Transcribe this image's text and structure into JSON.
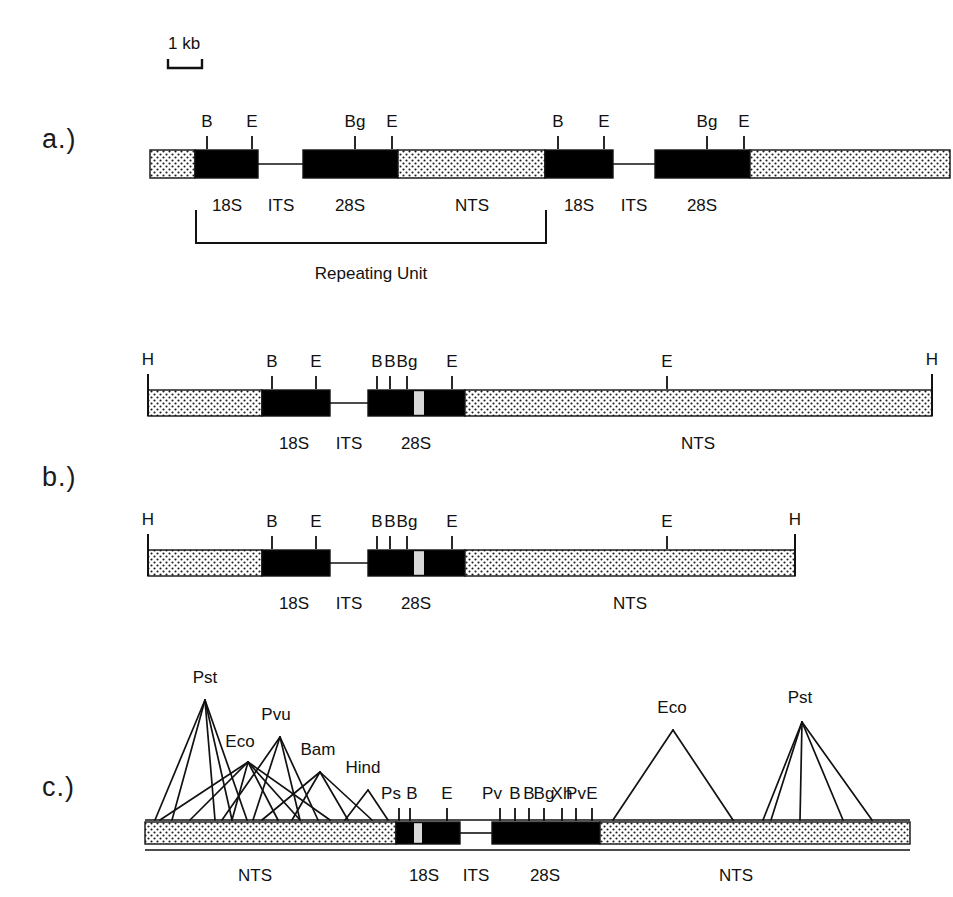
{
  "figure": {
    "type": "restriction-map-diagram",
    "scale_bar": {
      "label": "1 kb",
      "x": 168,
      "y": 48,
      "bar_left": 168,
      "bar_right": 202,
      "bar_y": 68
    },
    "panels": [
      {
        "id": "a",
        "letter": "a.)",
        "letter_x": 42,
        "letter_y": 142,
        "description": "Tandemly repeated ribosomal DNA unit, two repeats shown",
        "axis": {
          "left": 150,
          "right": 950,
          "y": 150,
          "height": 28
        },
        "segments": [
          {
            "kind": "stipple",
            "x1": 150,
            "x2": 195,
            "label": ""
          },
          {
            "kind": "solid",
            "x1": 195,
            "x2": 258,
            "label": "18S"
          },
          {
            "kind": "line",
            "x1": 258,
            "x2": 303,
            "label": "ITS"
          },
          {
            "kind": "solid",
            "x1": 303,
            "x2": 398,
            "label": "28S"
          },
          {
            "kind": "stipple",
            "x1": 398,
            "x2": 545,
            "label": "NTS"
          },
          {
            "kind": "solid",
            "x1": 545,
            "x2": 613,
            "label": "18S"
          },
          {
            "kind": "line",
            "x1": 613,
            "x2": 655,
            "label": "ITS"
          },
          {
            "kind": "solid",
            "x1": 655,
            "x2": 750,
            "label": "28S"
          },
          {
            "kind": "stipple",
            "x1": 750,
            "x2": 950,
            "label": ""
          }
        ],
        "sites": [
          {
            "label": "B",
            "x": 207
          },
          {
            "label": "E",
            "x": 252
          },
          {
            "label": "Bg",
            "x": 355
          },
          {
            "label": "E",
            "x": 392
          },
          {
            "label": "B",
            "x": 558
          },
          {
            "label": "E",
            "x": 604
          },
          {
            "label": "Bg",
            "x": 707
          },
          {
            "label": "E",
            "x": 744
          }
        ],
        "region_labels": [
          {
            "text": "18S",
            "x": 227,
            "y": 196
          },
          {
            "text": "ITS",
            "x": 281,
            "y": 196
          },
          {
            "text": "28S",
            "x": 350,
            "y": 196
          },
          {
            "text": "NTS",
            "x": 472,
            "y": 196
          },
          {
            "text": "18S",
            "x": 579,
            "y": 196
          },
          {
            "text": "ITS",
            "x": 634,
            "y": 196
          },
          {
            "text": "28S",
            "x": 702,
            "y": 196
          }
        ],
        "bracket": {
          "label": "Repeating Unit",
          "x1": 196,
          "x2": 546,
          "y_top": 210,
          "y_bottom": 243,
          "label_x": 371,
          "label_y": 264
        }
      },
      {
        "id": "b",
        "letter": "b.)",
        "letter_x": 42,
        "letter_y": 480,
        "description": "Two HindIII repeat-length variants of the rDNA unit",
        "maps": [
          {
            "axis": {
              "left": 148,
              "right": 932,
              "y": 390,
              "height": 26
            },
            "segments": [
              {
                "kind": "stipple",
                "x1": 148,
                "x2": 262,
                "label": ""
              },
              {
                "kind": "solid",
                "x1": 262,
                "x2": 330,
                "label": "18S"
              },
              {
                "kind": "line",
                "x1": 330,
                "x2": 368,
                "label": "ITS"
              },
              {
                "kind": "solid",
                "x1": 368,
                "x2": 465,
                "label": "28S"
              },
              {
                "kind": "stipple",
                "x1": 465,
                "x2": 932,
                "label": "NTS"
              }
            ],
            "inner_gap": {
              "x1": 414,
              "x2": 424
            },
            "end_ticks": [
              {
                "label": "H",
                "x": 148
              },
              {
                "label": "H",
                "x": 932
              }
            ],
            "sites": [
              {
                "label": "B",
                "x": 272
              },
              {
                "label": "E",
                "x": 316
              },
              {
                "label": "B",
                "x": 377
              },
              {
                "label": "B",
                "x": 390
              },
              {
                "label": "Bg",
                "x": 407
              },
              {
                "label": "E",
                "x": 452
              },
              {
                "label": "E",
                "x": 667
              }
            ],
            "region_labels": [
              {
                "text": "18S",
                "x": 294,
                "y": 434
              },
              {
                "text": "ITS",
                "x": 349,
                "y": 434
              },
              {
                "text": "28S",
                "x": 416,
                "y": 434
              },
              {
                "text": "NTS",
                "x": 698,
                "y": 434
              }
            ]
          },
          {
            "axis": {
              "left": 148,
              "right": 795,
              "y": 550,
              "height": 26
            },
            "segments": [
              {
                "kind": "stipple",
                "x1": 148,
                "x2": 262,
                "label": ""
              },
              {
                "kind": "solid",
                "x1": 262,
                "x2": 330,
                "label": "18S"
              },
              {
                "kind": "line",
                "x1": 330,
                "x2": 368,
                "label": "ITS"
              },
              {
                "kind": "solid",
                "x1": 368,
                "x2": 465,
                "label": "28S"
              },
              {
                "kind": "stipple",
                "x1": 465,
                "x2": 795,
                "label": "NTS"
              }
            ],
            "inner_gap": {
              "x1": 414,
              "x2": 424
            },
            "end_ticks": [
              {
                "label": "H",
                "x": 148
              },
              {
                "label": "H",
                "x": 795
              }
            ],
            "sites": [
              {
                "label": "B",
                "x": 272
              },
              {
                "label": "E",
                "x": 316
              },
              {
                "label": "B",
                "x": 377
              },
              {
                "label": "B",
                "x": 390
              },
              {
                "label": "Bg",
                "x": 407
              },
              {
                "label": "E",
                "x": 452
              },
              {
                "label": "E",
                "x": 667
              }
            ],
            "region_labels": [
              {
                "text": "18S",
                "x": 294,
                "y": 594
              },
              {
                "text": "ITS",
                "x": 349,
                "y": 594
              },
              {
                "text": "28S",
                "x": 416,
                "y": 594
              },
              {
                "text": "NTS",
                "x": 630,
                "y": 594
              }
            ]
          }
        ]
      },
      {
        "id": "c",
        "letter": "c.)",
        "letter_x": 42,
        "letter_y": 790,
        "description": "Restriction enzyme cleavage sites mapped onto the repeat, shown as fan clusters",
        "axis": {
          "left": 145,
          "right": 910,
          "y": 822,
          "height": 22
        },
        "segments": [
          {
            "kind": "stipple",
            "x1": 145,
            "x2": 396,
            "label": "NTS"
          },
          {
            "kind": "solid",
            "x1": 396,
            "x2": 460,
            "label": "18S"
          },
          {
            "kind": "line",
            "x1": 460,
            "x2": 492,
            "label": "ITS"
          },
          {
            "kind": "solid",
            "x1": 492,
            "x2": 600,
            "label": "28S"
          },
          {
            "kind": "stipple",
            "x1": 600,
            "x2": 910,
            "label": "NTS"
          }
        ],
        "inner_gap": {
          "x1": 414,
          "x2": 422
        },
        "region_labels": [
          {
            "text": "NTS",
            "x": 255,
            "y": 866
          },
          {
            "text": "18S",
            "x": 424,
            "y": 866
          },
          {
            "text": "ITS",
            "x": 476,
            "y": 866
          },
          {
            "text": "28S",
            "x": 545,
            "y": 866
          },
          {
            "text": "NTS",
            "x": 736,
            "y": 866
          }
        ],
        "fans": [
          {
            "enzyme": "Pst",
            "label_x": 205,
            "label_y": 688,
            "apex_x": 205,
            "apex_y": 700,
            "targets": [
              155,
              172,
              215,
              232,
              247
            ]
          },
          {
            "enzyme": "Eco",
            "label_x": 240,
            "label_y": 752,
            "apex_x": 248,
            "apex_y": 762,
            "targets": [
              160,
              190,
              232,
              278,
              300,
              330
            ]
          },
          {
            "enzyme": "Pvu",
            "label_x": 276,
            "label_y": 725,
            "apex_x": 280,
            "apex_y": 737,
            "targets": [
              222,
              253,
              300,
              318
            ]
          },
          {
            "enzyme": "Bam",
            "label_x": 318,
            "label_y": 760,
            "apex_x": 320,
            "apex_y": 772,
            "targets": [
              262,
              292,
              348,
              372
            ]
          },
          {
            "enzyme": "Hind",
            "label_x": 363,
            "label_y": 778,
            "apex_x": 368,
            "apex_y": 790,
            "targets": [
              345,
              388
            ]
          },
          {
            "enzyme": "Eco",
            "label_x": 672,
            "label_y": 718,
            "apex_x": 673,
            "apex_y": 730,
            "targets": [
              613,
              733
            ]
          },
          {
            "enzyme": "Pst",
            "label_x": 800,
            "label_y": 708,
            "apex_x": 802,
            "apex_y": 722,
            "targets": [
              763,
              771,
              800,
              843,
              872
            ]
          }
        ],
        "sites": [
          {
            "label": "Ps",
            "x": 399,
            "label_dx": -8
          },
          {
            "label": "B",
            "x": 410,
            "label_dx": 2
          },
          {
            "label": "E",
            "x": 447,
            "label_dx": 0
          },
          {
            "label": "Pv",
            "x": 500,
            "label_dx": -8
          },
          {
            "label": "B",
            "x": 515,
            "label_dx": 0
          },
          {
            "label": "B",
            "x": 529,
            "label_dx": 0
          },
          {
            "label": "Bg",
            "x": 544,
            "label_dx": 0
          },
          {
            "label": "Xh",
            "x": 562,
            "label_dx": 0
          },
          {
            "label": "Pv",
            "x": 576,
            "label_dx": 0
          },
          {
            "label": "E",
            "x": 592,
            "label_dx": 0
          }
        ]
      }
    ],
    "colors": {
      "ink": "#111111",
      "coding_block": "#000000",
      "spacer_fill": "#f4f4f2",
      "background": "#ffffff"
    }
  }
}
